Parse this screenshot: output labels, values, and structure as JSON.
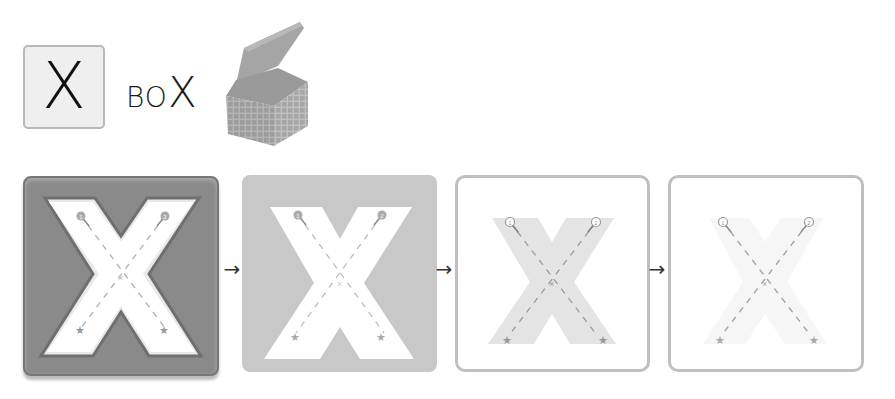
{
  "header": {
    "letter_card": {
      "letter": "X"
    },
    "word": {
      "prefix": "BO",
      "highlight": "X",
      "full": "BOX"
    },
    "illustration": {
      "icon": "open-cardboard-box",
      "description": "open box with grid pattern"
    }
  },
  "steps": [
    {
      "index": 1,
      "style": "embossed-dark-tile",
      "letter": "X",
      "stroke_start_markers": [
        "1",
        "2"
      ],
      "stroke_end_markers": [
        "star",
        "star"
      ],
      "background": "#8a8a8a"
    },
    {
      "index": 2,
      "style": "flat-gray-tile",
      "letter": "X",
      "stroke_start_markers": [
        "1",
        "2"
      ],
      "stroke_end_markers": [
        "star",
        "star"
      ],
      "background": "#c8c8c8"
    },
    {
      "index": 3,
      "style": "outlined-light-letter",
      "letter": "X",
      "stroke_start_markers": [
        "1",
        "2"
      ],
      "stroke_end_markers": [
        "star",
        "star"
      ],
      "background": "#ffffff"
    },
    {
      "index": 4,
      "style": "outlined-faint-letter",
      "letter": "X",
      "stroke_start_markers": [
        "1",
        "2"
      ],
      "stroke_end_markers": [
        "star",
        "star"
      ],
      "background": "#ffffff"
    }
  ],
  "arrows": [
    "→",
    "→",
    "→"
  ],
  "colors": {
    "tile_dark": "#8a8a8a",
    "tile_mid": "#c8c8c8",
    "letter_light": "#e4e4e4",
    "letter_faint": "#f6f6f6",
    "guide": "#9a9a9a",
    "frame": "#bfbfbf"
  }
}
